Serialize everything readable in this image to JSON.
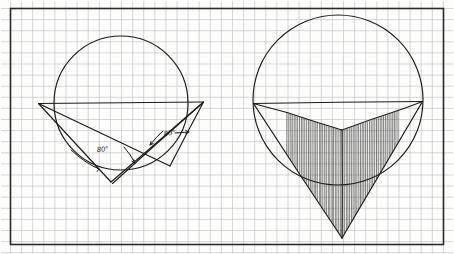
{
  "document": {
    "kind": "hand-drawn-geometry-diagram",
    "medium": "graph-paper",
    "panel_count": 2
  },
  "canvas": {
    "width": 454,
    "height": 254,
    "background_color": "#fdfdfc"
  },
  "grid": {
    "label": "graph-paper-grid",
    "cell_size": 11.1,
    "line_color": "#b9bcc2",
    "line_width": 0.6,
    "origin_x": 10.5,
    "origin_y": 8.5,
    "cols": 39,
    "rows": 21
  },
  "border": {
    "label": "diagram-frame",
    "x": 10.5,
    "y": 8.5,
    "width": 433,
    "height": 236,
    "color": "#2a2a28",
    "line_width": 1.6
  },
  "ink": {
    "stroke_color": "#1d1c18",
    "hatch_color": "#1d1c18"
  },
  "left_figure": {
    "name": "inscribed-angles-figure",
    "circle": {
      "cx": 121,
      "cy": 103,
      "r": 67,
      "label": "left-circle"
    },
    "diameter": {
      "label": "horizontal-diameter-chord",
      "x1": 38.5,
      "y1": 103.5,
      "x2": 203.5,
      "y2": 102.0
    },
    "vertices": {
      "A": {
        "x": 38.5,
        "y": 103.5,
        "label": "left-endpoint"
      },
      "B": {
        "x": 203.5,
        "y": 102.0,
        "label": "right-endpoint"
      },
      "C": {
        "x": 111.0,
        "y": 182.0,
        "label": "lower-left-apex"
      },
      "D": {
        "x": 170.0,
        "y": 166.0,
        "label": "lower-right-apex"
      }
    },
    "chords": [
      {
        "name": "chord-A-C",
        "x1": 38.5,
        "y1": 103.5,
        "x2": 111.0,
        "y2": 182.0
      },
      {
        "name": "chord-C-B",
        "x1": 111.0,
        "y1": 182.0,
        "x2": 203.5,
        "y2": 102.0
      },
      {
        "name": "chord-A-D",
        "x1": 38.5,
        "y1": 103.5,
        "x2": 170.0,
        "y2": 166.0
      },
      {
        "name": "chord-D-B",
        "x1": 170.0,
        "y1": 166.0,
        "x2": 203.5,
        "y2": 102.0
      },
      {
        "name": "chord-C-B-inner",
        "x1": 112.5,
        "y1": 183.5,
        "x2": 202.5,
        "y2": 103.0
      }
    ],
    "angles": [
      {
        "name": "angle-at-C",
        "value": "80°",
        "label_x": 97,
        "label_y": 152,
        "vertex_x": 111.0,
        "vertex_y": 182.0,
        "arc_r": 36
      },
      {
        "name": "angle-at-D",
        "value": "80°",
        "label_x": 164,
        "label_y": 136,
        "vertex_x": 170.0,
        "vertex_y": 166.0,
        "arc_r": 27
      }
    ]
  },
  "right_figure": {
    "name": "hatched-inscribed-triangle-figure",
    "circle": {
      "cx": 338,
      "cy": 100,
      "r": 85,
      "label": "right-circle"
    },
    "diameter": {
      "label": "horizontal-diameter-chord",
      "x1": 253.5,
      "y1": 103.5,
      "x2": 422.5,
      "y2": 101.5
    },
    "vertices": {
      "A": {
        "x": 253.5,
        "y": 103.5,
        "label": "left-endpoint"
      },
      "B": {
        "x": 422.5,
        "y": 101.5,
        "label": "right-endpoint"
      },
      "V": {
        "x": 342.0,
        "y": 238.0,
        "label": "bottom-apex"
      },
      "M": {
        "x": 342.0,
        "y": 130.0,
        "label": "inner-fold-apex"
      },
      "L": {
        "x": 287.0,
        "y": 112.5,
        "label": "inner-left-shoulder"
      },
      "R": {
        "x": 398.0,
        "y": 110.5,
        "label": "inner-right-shoulder"
      }
    },
    "outer_triangle": [
      {
        "name": "edge-A-V",
        "x1": 253.5,
        "y1": 103.5,
        "x2": 342.0,
        "y2": 238.0
      },
      {
        "name": "edge-V-B",
        "x1": 342.0,
        "y1": 238.0,
        "x2": 422.5,
        "y2": 101.5
      }
    ],
    "inner_fold": [
      {
        "name": "fold-L-M",
        "x1": 287.0,
        "y1": 112.5,
        "x2": 342.0,
        "y2": 130.0
      },
      {
        "name": "fold-M-R",
        "x1": 342.0,
        "y1": 130.0,
        "x2": 398.0,
        "y2": 110.5
      },
      {
        "name": "fold-A-L",
        "x1": 253.5,
        "y1": 103.5,
        "x2": 287.0,
        "y2": 112.5
      },
      {
        "name": "fold-R-B",
        "x1": 398.0,
        "y1": 110.5,
        "x2": 422.5,
        "y2": 101.5
      },
      {
        "name": "fold-center-axis",
        "x1": 342.0,
        "y1": 130.0,
        "x2": 342.0,
        "y2": 238.0
      }
    ],
    "hatching": {
      "label": "vertical-hatch-fill",
      "orientation": "vertical",
      "line_count": 62,
      "spacing": 1.85,
      "left_x": 287.0,
      "right_x": 398.0
    }
  }
}
